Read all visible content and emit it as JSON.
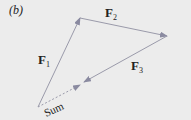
{
  "panel_label": "(b)",
  "vectors": [
    {
      "name": "F",
      "subscript": "1",
      "from": [
        38,
        107
      ],
      "to": [
        80,
        18
      ]
    },
    {
      "name": "F",
      "subscript": "2",
      "from": [
        80,
        18
      ],
      "to": [
        167,
        36
      ]
    },
    {
      "name": "F",
      "subscript": "3",
      "from": [
        167,
        36
      ],
      "to": [
        84,
        82
      ]
    }
  ],
  "sum": {
    "label": "Sum",
    "from": [
      38,
      107
    ],
    "to": [
      80,
      85
    ],
    "style": "dashed"
  },
  "colors": {
    "background": "#ececec",
    "arrow": "#8a8aa0",
    "text": "#222222"
  }
}
